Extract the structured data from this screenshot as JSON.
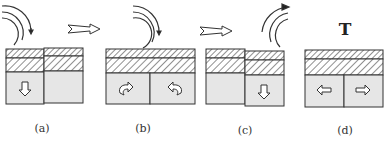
{
  "figure": {
    "panels": [
      {
        "id": "a",
        "label": "(a)",
        "tool": "rotating-tool-above-left-block",
        "arrow": "down-left-block"
      },
      {
        "id": "b",
        "label": "(b)",
        "tool": "rotating-tool-above-joint",
        "arrow": "curved-rotation-both-blocks"
      },
      {
        "id": "c",
        "label": "(c)",
        "tool": "rotating-tool-above-right-block",
        "arrow": "down-right-block"
      },
      {
        "id": "d",
        "label": "(d)",
        "tool": "none",
        "arrow": "outward-left-right",
        "marker": "T"
      }
    ],
    "transitions": [
      "a-to-b",
      "b-to-c"
    ],
    "colors": {
      "ink": "#2b2b2b",
      "fill_gray": "#e6e6e6",
      "background": "#ffffff"
    }
  }
}
